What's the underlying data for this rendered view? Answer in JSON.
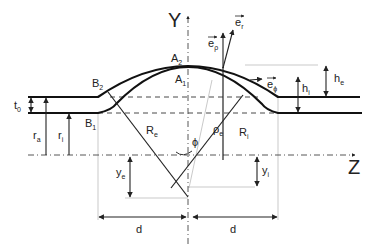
{
  "diagram": {
    "axes": {
      "y_label": "Y",
      "z_label": "Z"
    },
    "points": {
      "A2": {
        "base": "A",
        "sub": "2"
      },
      "A1": {
        "base": "A",
        "sub": "1"
      },
      "B2": {
        "base": "B",
        "sub": "2"
      },
      "B1": {
        "base": "B",
        "sub": "1"
      }
    },
    "vectors": {
      "e_r": {
        "base": "e",
        "sub": "r"
      },
      "e_rho": {
        "base": "e",
        "sub": "ρ"
      },
      "e_phi": {
        "base": "e",
        "sub": "ϕ"
      }
    },
    "dimensions": {
      "t0": {
        "base": "t",
        "sub": "0"
      },
      "ra": {
        "base": "r",
        "sub": "a"
      },
      "ri": {
        "base": "r",
        "sub": "i"
      },
      "Re": {
        "base": "R",
        "sub": "e"
      },
      "Ri": {
        "base": "R",
        "sub": "i"
      },
      "rho_e": {
        "base": "ρ",
        "sub": "e"
      },
      "phi": {
        "base": "ϕ",
        "sub": ""
      },
      "ye": {
        "base": "y",
        "sub": "e"
      },
      "yi": {
        "base": "y",
        "sub": "i"
      },
      "hi": {
        "base": "h",
        "sub": "i"
      },
      "he": {
        "base": "h",
        "sub": "e"
      },
      "d_left": {
        "base": "d",
        "sub": ""
      },
      "d_right": {
        "base": "d",
        "sub": ""
      }
    }
  }
}
